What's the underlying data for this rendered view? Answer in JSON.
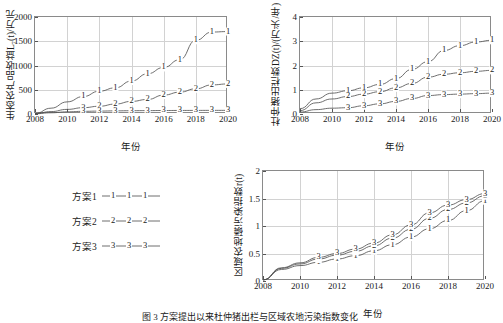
{
  "figure": {
    "caption": "图 3  方案提出以来杜仲猪出栏与区域农地污染指数变化",
    "legend": {
      "items": [
        {
          "label": "方案1",
          "marker": "1"
        },
        {
          "label": "方案2",
          "marker": "2"
        },
        {
          "label": "方案3",
          "marker": "3"
        }
      ]
    }
  },
  "chart_data": [
    {
      "id": "chart-eco-product-revenue",
      "type": "line",
      "title": "",
      "xlabel": "年份",
      "ylabel": "生态农产品收益L₇(t)/万元",
      "xlim": [
        2008,
        2020
      ],
      "ylim": [
        0,
        2000
      ],
      "xticks": [
        2008,
        2010,
        2012,
        2014,
        2016,
        2018,
        2020
      ],
      "yticks": [
        0,
        500,
        1000,
        1500,
        2000
      ],
      "grid": true,
      "legend_position": "external-left",
      "x": [
        2008,
        2009,
        2010,
        2011,
        2012,
        2013,
        2014,
        2015,
        2016,
        2017,
        2018,
        2019,
        2020
      ],
      "series": [
        {
          "name": "方案1",
          "marker": "1",
          "values": [
            10,
            120,
            250,
            360,
            470,
            540,
            680,
            830,
            960,
            1120,
            1520,
            1690,
            1700
          ]
        },
        {
          "name": "方案2",
          "marker": "2",
          "values": [
            8,
            50,
            95,
            130,
            160,
            205,
            260,
            300,
            390,
            450,
            520,
            600,
            620
          ]
        },
        {
          "name": "方案3",
          "marker": "3",
          "values": [
            5,
            25,
            45,
            55,
            60,
            65,
            68,
            70,
            72,
            73,
            74,
            75,
            75
          ]
        }
      ]
    },
    {
      "id": "chart-duzhong-pig-output",
      "type": "line",
      "title": "",
      "xlabel": "年份",
      "ylabel": "杜仲猪出栏数DZ(t)/(万头/年)",
      "xlim": [
        2008,
        2020
      ],
      "ylim": [
        0,
        4
      ],
      "xticks": [
        2008,
        2010,
        2012,
        2014,
        2016,
        2018,
        2020
      ],
      "yticks": [
        0,
        1,
        2,
        3,
        4
      ],
      "grid": true,
      "legend_position": "external-left",
      "x": [
        2008,
        2009,
        2010,
        2011,
        2012,
        2013,
        2014,
        2015,
        2016,
        2017,
        2018,
        2019,
        2020
      ],
      "series": [
        {
          "name": "方案1",
          "marker": "1",
          "values": [
            0.22,
            0.62,
            0.86,
            0.96,
            1.08,
            1.22,
            1.46,
            1.84,
            2.16,
            2.62,
            2.82,
            2.97,
            3.04
          ]
        },
        {
          "name": "方案2",
          "marker": "2",
          "values": [
            0.14,
            0.46,
            0.62,
            0.72,
            0.82,
            0.92,
            1.08,
            1.26,
            1.52,
            1.64,
            1.7,
            1.76,
            1.8
          ]
        },
        {
          "name": "方案3",
          "marker": "3",
          "values": [
            0.08,
            0.18,
            0.24,
            0.26,
            0.34,
            0.42,
            0.52,
            0.64,
            0.76,
            0.8,
            0.82,
            0.84,
            0.86
          ]
        }
      ]
    },
    {
      "id": "chart-farmland-phosphorus-index",
      "type": "line",
      "title": "",
      "xlabel": "年份",
      "ylabel": "区域农地磷污染指数r(t)",
      "xlim": [
        2008,
        2020
      ],
      "ylim": [
        0,
        2
      ],
      "xticks": [
        2008,
        2010,
        2012,
        2014,
        2016,
        2018,
        2020
      ],
      "yticks": [
        0,
        0.5,
        1,
        1.5,
        2
      ],
      "grid": true,
      "legend_position": "external-left",
      "x": [
        2008,
        2009,
        2010,
        2011,
        2012,
        2013,
        2014,
        2015,
        2016,
        2017,
        2018,
        2019,
        2020
      ],
      "series": [
        {
          "name": "方案1",
          "marker": "1",
          "values": [
            0.02,
            0.21,
            0.28,
            0.34,
            0.4,
            0.46,
            0.55,
            0.66,
            0.8,
            0.95,
            1.1,
            1.28,
            1.46
          ]
        },
        {
          "name": "方案2",
          "marker": "2",
          "values": [
            0.02,
            0.23,
            0.31,
            0.4,
            0.47,
            0.54,
            0.64,
            0.78,
            0.94,
            1.14,
            1.3,
            1.42,
            1.55
          ]
        },
        {
          "name": "方案3",
          "marker": "3",
          "values": [
            0.02,
            0.24,
            0.33,
            0.43,
            0.5,
            0.58,
            0.69,
            0.84,
            1.02,
            1.24,
            1.38,
            1.48,
            1.59
          ]
        }
      ]
    }
  ]
}
